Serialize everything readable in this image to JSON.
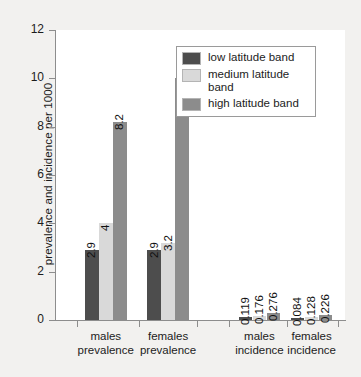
{
  "chart_data": {
    "type": "bar",
    "title": "",
    "subtitle": "",
    "xlabel": "",
    "ylabel": "prevalence and incidence per 1000",
    "ylim": [
      0,
      12
    ],
    "yticks": [
      0,
      2,
      4,
      6,
      8,
      10,
      12
    ],
    "ytick_labels": [
      "0",
      "2",
      "4",
      "6",
      "8",
      "10",
      "12"
    ],
    "grid": false,
    "legend_position": "top-right",
    "categories": [
      "males prevalence",
      "females prevalence",
      "males incidence",
      "females incidence"
    ],
    "category_lines": [
      [
        "males",
        "prevalence"
      ],
      [
        "females",
        "prevalence"
      ],
      [
        "males",
        "incidence"
      ],
      [
        "females",
        "incidence"
      ]
    ],
    "series": [
      {
        "name": "low latitude band",
        "color": "#4d4d4d",
        "values": [
          2.9,
          2.9,
          0.119,
          0.084
        ],
        "labels": [
          "2.9",
          "2.9",
          "0.119",
          "0.084"
        ]
      },
      {
        "name": "medium latitude band",
        "color": "#d9d9d9",
        "values": [
          4,
          3.2,
          0.176,
          0.128
        ],
        "labels": [
          "4",
          "3.2",
          "0.176",
          "0.128"
        ]
      },
      {
        "name": "high latitude band",
        "color": "#8c8c8c",
        "values": [
          8.2,
          10,
          0.276,
          0.226
        ],
        "labels": [
          "8.2",
          "10",
          "0.276",
          "0.226"
        ]
      }
    ]
  },
  "legend": {
    "items": [
      {
        "label": "low latitude band",
        "color": "#4d4d4d"
      },
      {
        "label": "medium latitude band",
        "color": "#d9d9d9"
      },
      {
        "label": "high latitude band",
        "color": "#8c8c8c"
      }
    ]
  },
  "axes": {
    "y_title": "prevalence and incidence per 1000",
    "y_tick_labels": [
      "12",
      "10",
      "8",
      "6",
      "4",
      "2",
      "0"
    ]
  },
  "colors": {
    "background": "#f2f1ef",
    "plot_background": "#ffffff",
    "axis": "#8d8d8d",
    "text": "#1c1c1c"
  }
}
